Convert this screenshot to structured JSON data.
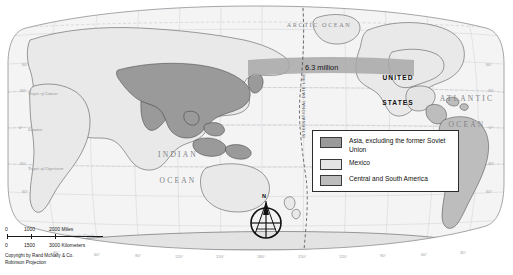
{
  "map": {
    "projection_note": "Robinson Projection",
    "copyright": "Copyright by Rand McNally & Co.",
    "callout": "6.3 million",
    "dateline_label": "INTERNATIONAL DATE LINE",
    "compass_north": "N"
  },
  "ocean_labels": [
    {
      "id": "arctic",
      "line1": "ARCTIC OCEAN",
      "line2": ""
    },
    {
      "id": "pacific",
      "line1": "PACIFIC",
      "line2": "OCEAN"
    },
    {
      "id": "atlantic",
      "line1": "ATLANTIC",
      "line2": "OCEAN"
    },
    {
      "id": "indian",
      "line1": "INDIAN",
      "line2": "OCEAN"
    }
  ],
  "country_labels": [
    {
      "id": "united-states",
      "line1": "UNITED",
      "line2": "STATES"
    }
  ],
  "reference_lines": [
    {
      "id": "tropic-of-cancer",
      "label": "Tropic of Cancer"
    },
    {
      "id": "equator",
      "label": "Equator"
    },
    {
      "id": "tropic-of-capricorn",
      "label": "Tropic of Capricorn"
    },
    {
      "id": "antarctic-circle",
      "label": "Antarctic Circle"
    }
  ],
  "latitude_labels": [
    "60°",
    "30°",
    "0°",
    "30°",
    "60°"
  ],
  "longitude_labels": [
    "30°",
    "60°",
    "90°",
    "120°",
    "150°",
    "180°",
    "150°",
    "120°",
    "90°",
    "60°",
    "30°"
  ],
  "legend": {
    "items": [
      {
        "id": "asia",
        "label": "Asia, excluding the\nformer Soviet Union",
        "color": "#9a9a9a"
      },
      {
        "id": "mexico",
        "label": "Mexico",
        "color": "#e4e4e4"
      },
      {
        "id": "csa",
        "label": "Central and South America",
        "color": "#bdbdbd"
      }
    ]
  },
  "scale": {
    "miles": {
      "zero": "0",
      "mid": "1000",
      "max": "2000 Miles"
    },
    "kilometers": {
      "zero": "0",
      "mid": "1500",
      "max": "3000 Kilometers"
    }
  },
  "colors": {
    "land": "#e9e9e9",
    "ocean": "#f4f4f4",
    "asia_shade": "#9a9a9a",
    "mexico_shade": "#e4e4e4",
    "csa_shade": "#bdbdbd",
    "band": "#a8a8a8",
    "graticule": "#c9ccd0",
    "coast": "#2c2c2c"
  }
}
